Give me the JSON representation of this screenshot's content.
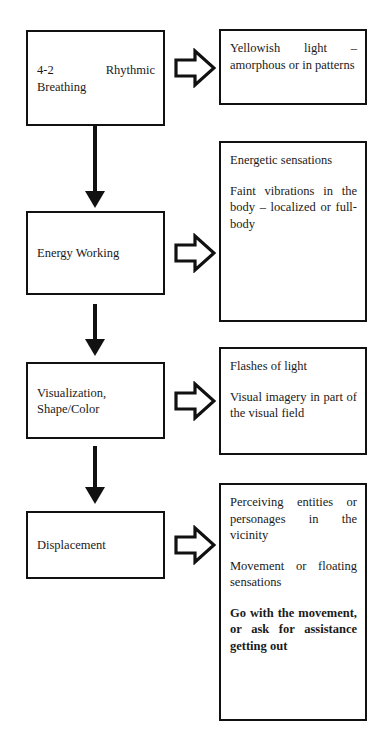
{
  "diagram": {
    "stroke_color": "#111111",
    "background_color": "#ffffff",
    "stages": [
      {
        "id": "rhythmic-breathing",
        "label": "4-2      Rhythmic Breathing",
        "arrow_icon": "block-arrow-right-icon",
        "effects": [
          {
            "text": "Yellowish light – amorphous or in patterns",
            "bold": false
          }
        ]
      },
      {
        "id": "energy-working",
        "label": "Energy Working",
        "arrow_icon": "block-arrow-right-icon",
        "effects": [
          {
            "text": "Energetic sensations",
            "bold": false
          },
          {
            "text": "Faint vibrations in the body – localized or full-body",
            "bold": false
          }
        ]
      },
      {
        "id": "visualization-shape-color",
        "label": "Visualization, Shape/Color",
        "arrow_icon": "block-arrow-right-icon",
        "effects": [
          {
            "text": "Flashes of light",
            "bold": false
          },
          {
            "text": "Visual imagery in part of the visual field",
            "bold": false
          }
        ]
      },
      {
        "id": "displacement",
        "label": "Displacement",
        "arrow_icon": "block-arrow-right-icon",
        "effects": [
          {
            "text": "Perceiving entities or personages in the vicinity",
            "bold": false
          },
          {
            "text": "Movement or floating sensations",
            "bold": false
          },
          {
            "text": "Go with the movement, or ask for assistance getting out",
            "bold": true
          }
        ]
      }
    ],
    "connectors": [
      {
        "id": "connector-1",
        "icon": "arrow-down-icon",
        "from": "rhythmic-breathing",
        "to": "energy-working"
      },
      {
        "id": "connector-2",
        "icon": "arrow-down-icon",
        "from": "energy-working",
        "to": "visualization-shape-color"
      },
      {
        "id": "connector-3",
        "icon": "arrow-down-icon",
        "from": "visualization-shape-color",
        "to": "displacement"
      }
    ]
  }
}
